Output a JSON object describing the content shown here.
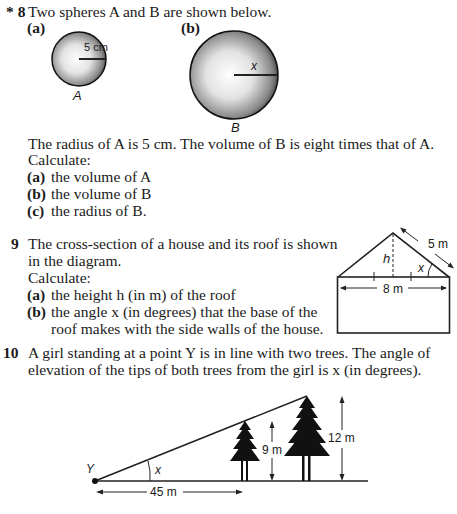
{
  "q8": {
    "marker": "* 8",
    "intro": "Two spheres A and B are shown below.",
    "fig_a_label": "(a)",
    "fig_b_label": "(b)",
    "sphere_a": {
      "name": "A",
      "radius_label": "5 cm"
    },
    "sphere_b": {
      "name": "B",
      "radius_label": "x"
    },
    "statement": "The radius of A is 5 cm. The volume of B is eight times that of A.",
    "calculate": "Calculate:",
    "parts": [
      {
        "label": "(a)",
        "text": "the volume of A"
      },
      {
        "label": "(b)",
        "text": "the volume of B"
      },
      {
        "label": "(c)",
        "text": "the radius of B."
      }
    ]
  },
  "q9": {
    "marker": "9",
    "intro_line1": "The cross-section of a house and its roof is shown",
    "intro_line2": "in the diagram.",
    "calculate": "Calculate:",
    "parts": [
      {
        "label": "(a)",
        "text": "the height h (in m) of the roof"
      },
      {
        "label": "(b)",
        "text": "the angle x (in degrees) that the base of the",
        "text2": "roof makes with the side walls of the house."
      }
    ],
    "diagram": {
      "slope_label": "5 m",
      "base_label": "8 m",
      "height_label": "h",
      "angle_label": "x"
    }
  },
  "q10": {
    "marker": "10",
    "intro_line1": "A girl standing at a point Y is in line with two trees. The angle of",
    "intro_line2": "elevation of the tips of both trees from the girl is x (in degrees).",
    "diagram": {
      "point_label": "Y",
      "angle_label": "x",
      "distance_label": "45 m",
      "tree1_height_label": "9 m",
      "tree2_height_label": "12 m"
    }
  }
}
